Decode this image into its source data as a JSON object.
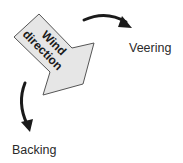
{
  "diagram": {
    "main_arrow": {
      "line1": "Wind",
      "line2": "direction",
      "fill": "#e6e6e6",
      "stroke": "#555555"
    },
    "labels": {
      "veering": "Veering",
      "backing": "Backing"
    },
    "curve_color": "#1a1a1a"
  }
}
